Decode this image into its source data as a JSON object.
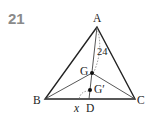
{
  "problem": {
    "number": "21"
  },
  "figure": {
    "type": "triangle-centroid-diagram",
    "points": {
      "A": {
        "label": "A",
        "x": 97,
        "y": 27
      },
      "B": {
        "label": "B",
        "x": 45,
        "y": 99
      },
      "C": {
        "label": "C",
        "x": 135,
        "y": 99
      },
      "G": {
        "label": "G",
        "x": 92,
        "y": 73
      },
      "G_prime": {
        "label": "G′",
        "x": 90,
        "y": 90
      },
      "D": {
        "label": "D",
        "x": 89,
        "y": 99
      }
    },
    "measurements": {
      "AD_length": "24",
      "unknown": "x"
    },
    "colors": {
      "stroke": "#222222",
      "thin_stroke": "#555555",
      "problem_number": "#8a8a8a"
    }
  }
}
